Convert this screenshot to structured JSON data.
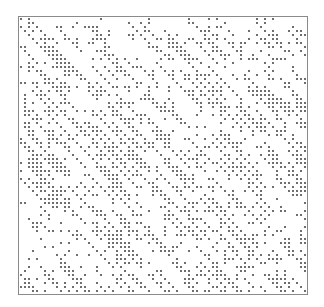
{
  "chart_data": {
    "type": "scatter",
    "title": "",
    "xlabel": "",
    "ylabel": "",
    "grid": false,
    "legend": null,
    "colors": {
      "dot": "#6e6e6e",
      "frame": "#8a8a8a",
      "background": "#ffffff"
    },
    "plot_box": {
      "x": 18,
      "y": 16,
      "width": 288,
      "height": 277
    },
    "dot_size": 2,
    "cell": 4,
    "random_density": 0.16,
    "diagonal_runs": 260,
    "main_diagonal": true,
    "seed": 12345
  }
}
